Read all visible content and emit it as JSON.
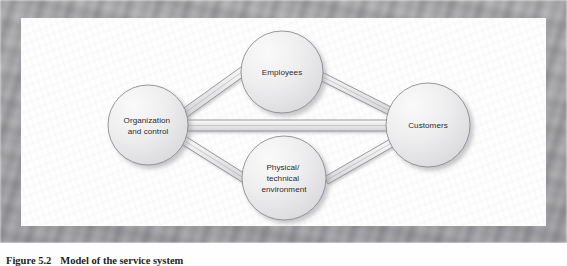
{
  "figure": {
    "caption_number": "Figure 5.2",
    "caption_title": "Model of the service system",
    "border_color": "#b0b0b4",
    "page_color": "#fefefe"
  },
  "diagram": {
    "type": "node-link",
    "node_fill_light": "#f2f2f3",
    "node_fill_dark": "#d9d9dc",
    "node_stroke": "#8d8d92",
    "connector_fill": "#e9e9ea",
    "connector_stroke": "#8a8a8f",
    "nodes": [
      {
        "id": "organization",
        "label_lines": [
          "Organization",
          "and control"
        ],
        "cx": 127,
        "cy": 107,
        "r": 40
      },
      {
        "id": "employees",
        "label_lines": [
          "Employees"
        ],
        "cx": 261,
        "cy": 54,
        "r": 41
      },
      {
        "id": "physical",
        "label_lines": [
          "Physical/",
          "technical",
          "environment"
        ],
        "cx": 263,
        "cy": 160,
        "r": 42
      },
      {
        "id": "customers",
        "label_lines": [
          "Customers"
        ],
        "cx": 407,
        "cy": 107,
        "r": 42
      }
    ],
    "links": [
      {
        "from": "organization",
        "to": "employees"
      },
      {
        "from": "employees",
        "to": "customers"
      },
      {
        "from": "organization",
        "to": "customers"
      },
      {
        "from": "organization",
        "to": "physical"
      },
      {
        "from": "physical",
        "to": "customers"
      }
    ]
  }
}
